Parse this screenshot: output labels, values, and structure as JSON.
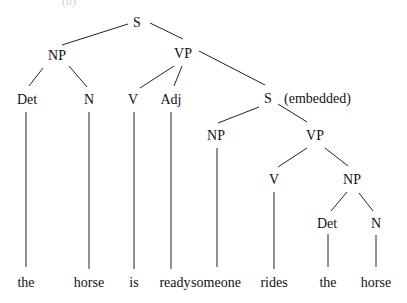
{
  "diagram": {
    "type": "syntax-tree",
    "clipped_top_label": "(b)",
    "nodes": [
      {
        "id": "S",
        "label": "S",
        "x": 137,
        "y": 22
      },
      {
        "id": "NP1",
        "label": "NP",
        "x": 57,
        "y": 55
      },
      {
        "id": "VP1",
        "label": "VP",
        "x": 183,
        "y": 53
      },
      {
        "id": "Det1",
        "label": "Det",
        "x": 27,
        "y": 99
      },
      {
        "id": "N1",
        "label": "N",
        "x": 89,
        "y": 99
      },
      {
        "id": "V1",
        "label": "V",
        "x": 133,
        "y": 99
      },
      {
        "id": "Adj1",
        "label": "Adj",
        "x": 171,
        "y": 99
      },
      {
        "id": "S2",
        "label": "S",
        "x": 268,
        "y": 98,
        "annotation": "(embedded)"
      },
      {
        "id": "NP2",
        "label": "NP",
        "x": 216,
        "y": 135
      },
      {
        "id": "VP2",
        "label": "VP",
        "x": 315,
        "y": 135
      },
      {
        "id": "V2",
        "label": "V",
        "x": 274,
        "y": 179
      },
      {
        "id": "NP3",
        "label": "NP",
        "x": 352,
        "y": 179
      },
      {
        "id": "Det2",
        "label": "Det",
        "x": 327,
        "y": 223
      },
      {
        "id": "N2",
        "label": "N",
        "x": 376,
        "y": 223
      }
    ],
    "words": [
      {
        "text": "the",
        "x": 26,
        "parent": "Det1"
      },
      {
        "text": "horse",
        "x": 89,
        "parent": "N1"
      },
      {
        "text": "is",
        "x": 134,
        "parent": "V1"
      },
      {
        "text": "ready",
        "x": 175,
        "parent": "Adj1"
      },
      {
        "text": "someone",
        "x": 216,
        "parent": "NP2"
      },
      {
        "text": "rides",
        "x": 274,
        "parent": "V2"
      },
      {
        "text": "the",
        "x": 328,
        "parent": "Det2"
      },
      {
        "text": "horse",
        "x": 376,
        "parent": "N2"
      }
    ],
    "word_baseline_y": 287,
    "edges": [
      {
        "x1": 128,
        "y1": 24,
        "x2": 62,
        "y2": 45
      },
      {
        "x1": 150,
        "y1": 23,
        "x2": 183,
        "y2": 39
      },
      {
        "x1": 43,
        "y1": 68,
        "x2": 29,
        "y2": 86
      },
      {
        "x1": 69,
        "y1": 66,
        "x2": 87,
        "y2": 87
      },
      {
        "x1": 174,
        "y1": 66,
        "x2": 140,
        "y2": 88
      },
      {
        "x1": 182,
        "y1": 66,
        "x2": 174,
        "y2": 86
      },
      {
        "x1": 199,
        "y1": 51,
        "x2": 265,
        "y2": 85
      },
      {
        "x1": 259,
        "y1": 107,
        "x2": 218,
        "y2": 123
      },
      {
        "x1": 278,
        "y1": 104,
        "x2": 307,
        "y2": 122
      },
      {
        "x1": 307,
        "y1": 148,
        "x2": 278,
        "y2": 167
      },
      {
        "x1": 325,
        "y1": 148,
        "x2": 348,
        "y2": 166
      },
      {
        "x1": 347,
        "y1": 192,
        "x2": 331,
        "y2": 211
      },
      {
        "x1": 359,
        "y1": 193,
        "x2": 373,
        "y2": 211
      },
      {
        "x1": 26,
        "y1": 112,
        "x2": 26,
        "y2": 267
      },
      {
        "x1": 89,
        "y1": 112,
        "x2": 89,
        "y2": 269
      },
      {
        "x1": 134,
        "y1": 112,
        "x2": 134,
        "y2": 269
      },
      {
        "x1": 171,
        "y1": 112,
        "x2": 171,
        "y2": 269
      },
      {
        "x1": 217,
        "y1": 148,
        "x2": 217,
        "y2": 267
      },
      {
        "x1": 274,
        "y1": 192,
        "x2": 274,
        "y2": 269
      },
      {
        "x1": 328,
        "y1": 234,
        "x2": 328,
        "y2": 267
      },
      {
        "x1": 376,
        "y1": 235,
        "x2": 376,
        "y2": 267
      }
    ]
  }
}
